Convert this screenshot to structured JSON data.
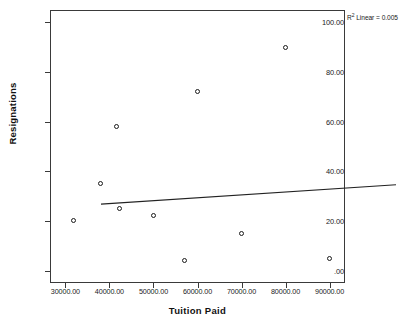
{
  "chart_data": {
    "type": "scatter",
    "title": "",
    "xlabel": "Tuition Paid",
    "ylabel": "Resignations",
    "xlim": [
      26500,
      93500
    ],
    "ylim": [
      -5,
      105
    ],
    "grid": false,
    "legend": "none",
    "annotation": {
      "r2_prefix": "R",
      "r2_superscript": "2",
      "r2_text": " Linear = 0.005",
      "r2_value": 0.005,
      "full_text": "R² Linear = 0.005"
    },
    "x_tick_labels": [
      "30000.00",
      "40000.00",
      "50000.00",
      "60000.00",
      "70000.00",
      "80000.00",
      "90000.00"
    ],
    "x_tick_values": [
      30000,
      40000,
      50000,
      60000,
      70000,
      80000,
      90000
    ],
    "y_tick_labels": [
      "100.00",
      "80.00",
      "60.00",
      "40.00",
      "20.00",
      ".00"
    ],
    "y_tick_values": [
      100,
      80,
      60,
      40,
      20,
      0
    ],
    "points": [
      {
        "x": 31900,
        "y": 20
      },
      {
        "x": 38000,
        "y": 35
      },
      {
        "x": 41500,
        "y": 58
      },
      {
        "x": 42200,
        "y": 25
      },
      {
        "x": 50000,
        "y": 22
      },
      {
        "x": 57000,
        "y": 4
      },
      {
        "x": 60000,
        "y": 72
      },
      {
        "x": 70000,
        "y": 15
      },
      {
        "x": 80000,
        "y": 90
      },
      {
        "x": 90000,
        "y": 5
      }
    ],
    "fit_line": {
      "type": "linear",
      "x_start": 26500,
      "y_start": 31.2,
      "x_end": 93500,
      "y_end": 39.0
    },
    "colors": {
      "axis": "#3a3a3a",
      "marker": "#1b1b1b",
      "fit_line": "#222222",
      "text": "#111111",
      "background": "#ffffff"
    }
  }
}
